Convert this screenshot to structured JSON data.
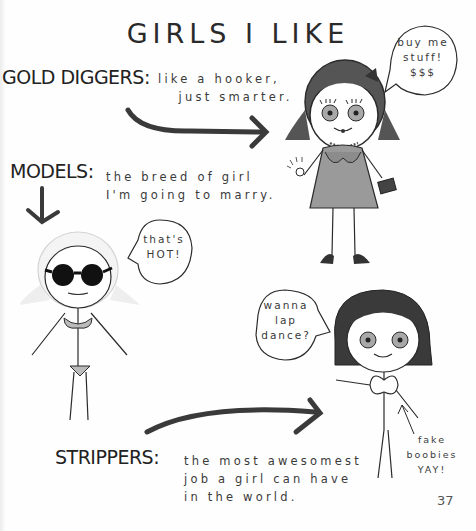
{
  "page": {
    "title": "GIRLS I LIKE",
    "page_number": "37"
  },
  "sections": [
    {
      "heading": "GOLD DIGGERS:",
      "description": "like a hooker,\n   just smarter.",
      "speech_bubble": "buy me\nstuff!\n$$$",
      "figure": "gold-digger-figure"
    },
    {
      "heading": "MODELS:",
      "description": "the breed of girl\nI'm going to marry.",
      "speech_bubble": "that's\nHOT!",
      "figure": "model-figure"
    },
    {
      "heading": "STRIPPERS:",
      "description": "the most awesomest\njob a girl can have\nin the world.",
      "speech_bubble": "wanna\nlap\ndance?",
      "annotation": "fake\nboobies\nYAY!",
      "figure": "stripper-figure"
    }
  ],
  "colors": {
    "ink": "#2b2b2b",
    "dress_gray": "#9a9a9a",
    "eye_gray": "#a8a8a8",
    "hair_dark": "#3a3a3a",
    "paper": "#fefefe"
  }
}
